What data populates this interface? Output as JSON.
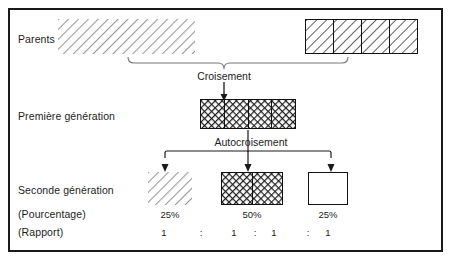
{
  "diagram": {
    "title_text_present": false,
    "rows": [
      {
        "id": "parents",
        "label": "Parents"
      },
      {
        "id": "first-generation",
        "label": "Première génération"
      },
      {
        "id": "second-generation",
        "label": "Seconde génération"
      },
      {
        "id": "percentage",
        "label": "(Pourcentage)"
      },
      {
        "id": "ratio",
        "label": "(Rapport)"
      }
    ],
    "process_labels": {
      "cross": "Croisement",
      "self_cross": "Autocroisement"
    },
    "parents": [
      {
        "name": "parent-left",
        "fill": "diagonal-light",
        "cells": 1,
        "bordered": false
      },
      {
        "name": "parent-right",
        "fill": "diagonal-dark",
        "cells": 4,
        "bordered": true
      }
    ],
    "first_generation": [
      {
        "name": "f1-hybrid",
        "fill": "crosshatch",
        "cells": 4,
        "bordered": true
      }
    ],
    "second_generation": [
      {
        "name": "f2-dominant",
        "fill": "diagonal-light",
        "cells": 1,
        "bordered": false,
        "percentage": "25%"
      },
      {
        "name": "f2-hybrid",
        "fill": "crosshatch",
        "cells": 2,
        "bordered": true,
        "percentage": "50%"
      },
      {
        "name": "f2-recessive",
        "fill": "blank",
        "cells": 1,
        "bordered": true,
        "percentage": "25%"
      }
    ],
    "ratio": {
      "values": [
        "1",
        "1",
        "1",
        "1"
      ],
      "separator": ":"
    },
    "colors": {
      "frame_border": "#1a1a1a",
      "text": "#1c1c1c",
      "hatch_light": "#9a9a9a",
      "hatch_dark": "#2a2a2a",
      "connector": "#555555",
      "arrow": "#1a1a1a",
      "blank_fill": "#ffffff"
    }
  }
}
